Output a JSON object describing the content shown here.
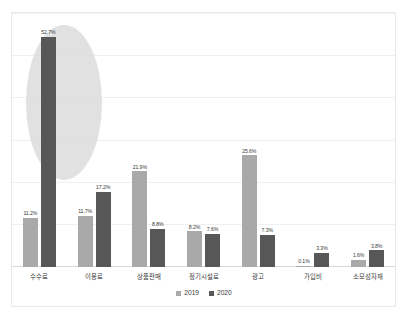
{
  "chart_data": {
    "type": "bar",
    "title": "",
    "subtitle": "",
    "xlabel": "",
    "ylabel": "",
    "ylim": [
      0,
      55
    ],
    "grid": true,
    "legend_position": "bottom",
    "categories": [
      "수수료",
      "이용료",
      "상품판매",
      "정기시설료",
      "광고",
      "가입비",
      "소모성자재"
    ],
    "series": [
      {
        "name": "2019",
        "color": "#a9a9a9",
        "values": [
          11.2,
          11.7,
          21.9,
          8.2,
          25.6,
          0.1,
          1.6
        ],
        "labels": [
          "11.2%",
          "11.7%",
          "21.9%",
          "8.2%",
          "25.6%",
          "0.1%",
          "1.6%"
        ]
      },
      {
        "name": "2020",
        "color": "#575757",
        "values": [
          52.7,
          17.2,
          8.8,
          7.6,
          7.3,
          3.3,
          3.8
        ],
        "labels": [
          "52.7%",
          "17.2%",
          "8.8%",
          "7.6%",
          "7.3%",
          "3.3%",
          "3.8%"
        ]
      }
    ],
    "annotations": [
      {
        "type": "ellipse-highlight",
        "target_category": "수수료",
        "color": "#dcdcdc"
      }
    ]
  },
  "legend": {
    "items": [
      {
        "label": "2019",
        "color": "#a9a9a9"
      },
      {
        "label": "2020",
        "color": "#575757"
      }
    ]
  },
  "colors": {
    "series_2019": "#a9a9a9",
    "series_2020": "#575757",
    "highlight": "#dcdcdc",
    "grid": "#f0f0f0",
    "frame": "#e9e9e9",
    "text": "#3a3a3a",
    "background": "#ffffff"
  }
}
